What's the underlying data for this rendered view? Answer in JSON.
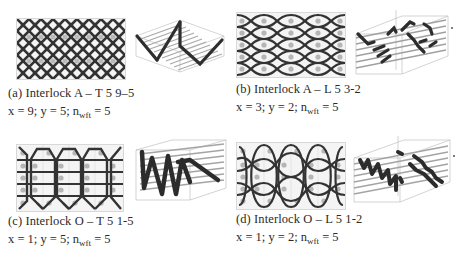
{
  "figure": {
    "panels": [
      {
        "id": "a",
        "label": "(a)",
        "title": "Interlock A – T 5 9–5",
        "caption": "(a) Interlock A – T 5 9–5",
        "params": {
          "x": "9",
          "y": "5",
          "n_wft": "5"
        },
        "x_text": "x = 9; y = 5; n",
        "sub": "wft",
        "eq_text": " = 5",
        "pattern": "dense-diamond-lattice",
        "view3d": "zigzag-through-thickness"
      },
      {
        "id": "b",
        "label": "(b)",
        "title": "Interlock A – L 5 3-2",
        "caption": "(b) Interlock A – L 5 3-2",
        "params": {
          "x": "3",
          "y": "2",
          "n_wft": "5"
        },
        "x_text": "x = 3; y = 2; n",
        "sub": "wft",
        "eq_text": " = 5",
        "pattern": "eye-shaped-lattice",
        "view3d": "layer-to-layer-stepped"
      },
      {
        "id": "c",
        "label": "(c)",
        "title": "Interlock O – T 5 1-5",
        "caption": "(c) Interlock O – T 5 1-5",
        "params": {
          "x": "1",
          "y": "5",
          "n_wft": "5"
        },
        "x_text": "x = 1; y = 5; n",
        "sub": "wft",
        "eq_text": " = 5",
        "pattern": "orthogonal-through-loops",
        "view3d": "orthogonal-vertical-zigzag"
      },
      {
        "id": "d",
        "label": "(d)",
        "title": "Interlock O – L 5 1-2",
        "caption": "(d) Interlock O – L 5 1-2",
        "params": {
          "x": "1",
          "y": "2",
          "n_wft": "5"
        },
        "x_text": "x = 1; y = 2; n",
        "sub": "wft",
        "eq_text": " = 5",
        "pattern": "orthogonal-layer-loops",
        "view3d": "orthogonal-layer-zigzag"
      }
    ],
    "colors": {
      "yarn": "#3a3a3a",
      "weft_dot": "#b5b5b5",
      "grid": "#d6d6d6",
      "box": "#bdbdbd",
      "weft_rod": "#9a9a9a"
    }
  }
}
